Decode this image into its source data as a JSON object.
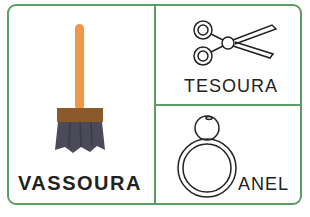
{
  "cards": [
    {
      "label": "VASSOURA",
      "icon": "broom-icon"
    },
    {
      "label": "TESOURA",
      "icon": "scissors-icon"
    },
    {
      "label": "ANEL",
      "icon": "ring-icon"
    }
  ],
  "colors": {
    "border": "#5a9e62",
    "handle": "#f0964a",
    "ferrule": "#8a5a2a",
    "bristles": "#4a4a58",
    "text": "#222222"
  }
}
